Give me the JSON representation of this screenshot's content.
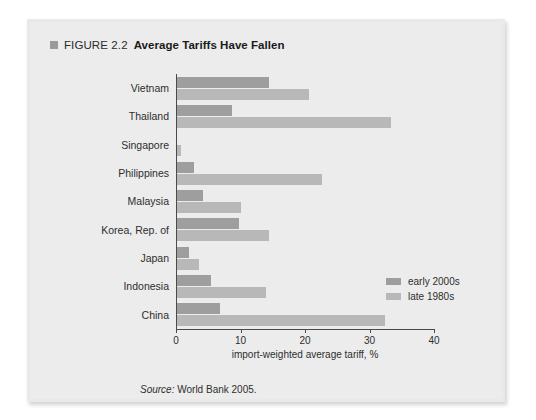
{
  "figure": {
    "number_label": "FIGURE 2.2",
    "title": "Average Tariffs Have Fallen",
    "source_prefix": "Source:",
    "source_text": "World Bank 2005."
  },
  "legend": {
    "position": "inside-right",
    "items": [
      {
        "label": "early 2000s",
        "color": "#9e9e9e"
      },
      {
        "label": "late 1980s",
        "color": "#b8b8b8"
      }
    ]
  },
  "axis": {
    "x_title": "import-weighted average tariff, %",
    "x_ticks": [
      "0",
      "10",
      "20",
      "30",
      "40"
    ]
  },
  "chart_data": {
    "type": "bar",
    "orientation": "horizontal",
    "title": "Average Tariffs Have Fallen",
    "subtitle": "",
    "xlabel": "import-weighted average tariff, %",
    "ylabel": "",
    "xlim": [
      0,
      40
    ],
    "xticks": [
      0,
      10,
      20,
      30,
      40
    ],
    "grid": false,
    "legend_position": "inside-right",
    "categories": [
      "Vietnam",
      "Thailand",
      "Singapore",
      "Philippines",
      "Malaysia",
      "Korea, Rep. of",
      "Japan",
      "Indonesia",
      "China"
    ],
    "series": [
      {
        "name": "early 2000s",
        "color": "#9e9e9e",
        "values": [
          14.2,
          8.6,
          0.0,
          2.6,
          4.1,
          9.6,
          1.8,
          5.2,
          6.6
        ]
      },
      {
        "name": "late 1980s",
        "color": "#b8b8b8",
        "values": [
          20.5,
          33.2,
          0.6,
          22.5,
          9.9,
          14.2,
          3.4,
          13.8,
          32.3
        ]
      }
    ],
    "source": "Source: World Bank 2005."
  }
}
